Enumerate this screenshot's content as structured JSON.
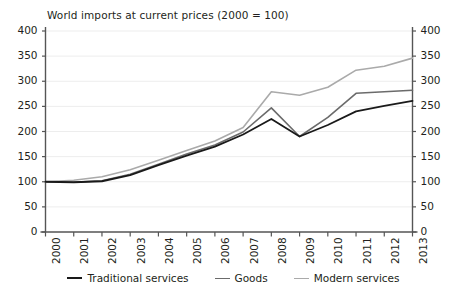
{
  "chart_data": {
    "type": "line",
    "title": "World imports at current prices (2000 = 100)",
    "xlabel": "",
    "ylabel": "",
    "ylim": [
      0,
      400
    ],
    "ytick_values": [
      0,
      50,
      100,
      150,
      200,
      250,
      300,
      350,
      400
    ],
    "ytick_labels": [
      "0",
      "50",
      "100",
      "150",
      "200",
      "250",
      "300",
      "350",
      "400"
    ],
    "dual_axis": true,
    "right_axis_same_as_left": true,
    "grid": true,
    "grid_axis": "y",
    "legend_position": "bottom",
    "categories": [
      2000,
      2001,
      2002,
      2003,
      2004,
      2005,
      2006,
      2007,
      2008,
      2009,
      2010,
      2011,
      2012,
      2013
    ],
    "xtick_labels": [
      "2000",
      "2001",
      "2002",
      "2003",
      "2004",
      "2005",
      "2006",
      "2007",
      "2008",
      "2009",
      "2010",
      "2011",
      "2012",
      "2013"
    ],
    "xtick_rotation": 90,
    "series": [
      {
        "name": "Traditional services",
        "color": "#1a1a1a",
        "values": [
          100,
          99,
          101,
          113,
          133,
          152,
          170,
          194,
          225,
          190,
          213,
          240,
          251,
          261
        ]
      },
      {
        "name": "Goods",
        "color": "#6b6b6b",
        "values": [
          100,
          99,
          102,
          115,
          135,
          155,
          173,
          199,
          247,
          190,
          228,
          276,
          279,
          282
        ]
      },
      {
        "name": "Modern services",
        "color": "#aaaaaa",
        "values": [
          100,
          103,
          110,
          124,
          143,
          162,
          181,
          208,
          279,
          272,
          288,
          322,
          330,
          346
        ]
      }
    ]
  },
  "colors": {
    "axis": "#555555",
    "grid": "#ededed",
    "text": "#231f20",
    "background": "#ffffff"
  },
  "legend": {
    "items": [
      {
        "label": "Traditional services"
      },
      {
        "label": "Goods"
      },
      {
        "label": "Modern services"
      }
    ]
  }
}
